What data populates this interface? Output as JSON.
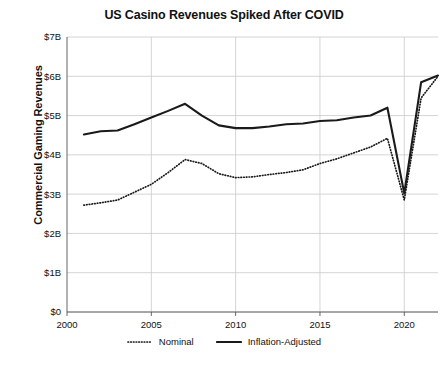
{
  "chart_data": {
    "type": "line",
    "title": "US Casino Revenues Spiked After COVID",
    "xlabel": "",
    "ylabel": "Commercial Gaming Revenues",
    "xlim": [
      2000,
      2022
    ],
    "ylim": [
      0,
      7
    ],
    "grid": true,
    "legend_position": "bottom",
    "y_tick_labels": [
      "$0",
      "$1B",
      "$2B",
      "$3B",
      "$4B",
      "$5B",
      "$6B",
      "$7B"
    ],
    "y_tick_values": [
      0,
      1,
      2,
      3,
      4,
      5,
      6,
      7
    ],
    "x_tick_labels": [
      "2000",
      "2005",
      "2010",
      "2015",
      "2020"
    ],
    "x_tick_values": [
      2000,
      2005,
      2010,
      2015,
      2020
    ],
    "x": [
      2001,
      2002,
      2003,
      2004,
      2005,
      2006,
      2007,
      2008,
      2009,
      2010,
      2011,
      2012,
      2013,
      2014,
      2015,
      2016,
      2017,
      2018,
      2019,
      2020,
      2021,
      2022
    ],
    "series": [
      {
        "name": "Nominal",
        "style": "dotted",
        "color": "#1a1a1a",
        "values": [
          2.72,
          2.78,
          2.85,
          3.05,
          3.25,
          3.55,
          3.88,
          3.78,
          3.52,
          3.42,
          3.44,
          3.5,
          3.55,
          3.62,
          3.78,
          3.9,
          4.05,
          4.2,
          4.42,
          2.85,
          5.45,
          6.0
        ]
      },
      {
        "name": "Inflation-Adjusted",
        "style": "solid",
        "color": "#1a1a1a",
        "values": [
          4.52,
          4.6,
          4.62,
          4.78,
          4.95,
          5.12,
          5.3,
          5.0,
          4.75,
          4.68,
          4.68,
          4.72,
          4.78,
          4.8,
          4.86,
          4.88,
          4.95,
          5.0,
          5.2,
          3.02,
          5.85,
          6.02
        ]
      }
    ]
  },
  "legend": {
    "items": [
      {
        "label": "Nominal",
        "style": "dotted"
      },
      {
        "label": "Inflation-Adjusted",
        "style": "solid"
      }
    ]
  }
}
